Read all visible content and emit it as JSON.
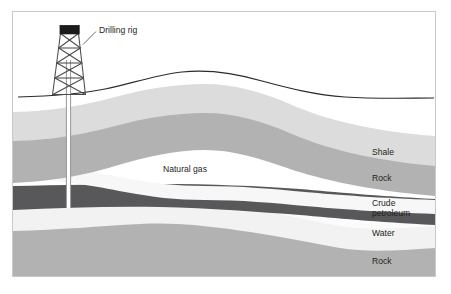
{
  "figure": {
    "title": "",
    "type": "geological-cross-section",
    "background_color": "#ffffff",
    "frame_border_color": "#c9c9c9"
  },
  "annotations": {
    "drilling_rig_label": "Drilling rig",
    "natural_gas_label": "Natural gas"
  },
  "side_labels": [
    {
      "text": "Shale",
      "color": "#dcdcdc"
    },
    {
      "text": "Rock",
      "color": "#b2b2b2"
    },
    {
      "text": "Crude",
      "color": "#58585a"
    },
    {
      "text": "petroleum",
      "color": "#58585a"
    },
    {
      "text": "Water",
      "color": "#f2f2f2"
    },
    {
      "text": "Rock",
      "color": "#b2b2b2"
    }
  ],
  "layers": [
    {
      "name": "sky-air",
      "label": "",
      "color": "#ffffff"
    },
    {
      "name": "shale",
      "label": "Shale",
      "color": "#dcdcdc"
    },
    {
      "name": "rock-upper",
      "label": "Rock",
      "color": "#b2b2b2"
    },
    {
      "name": "natural-gas",
      "label": "Natural gas",
      "color": "#f7f7f7"
    },
    {
      "name": "crude-petroleum",
      "label": "Crude petroleum",
      "color": "#58585a"
    },
    {
      "name": "water",
      "label": "Water",
      "color": "#f2f2f2"
    },
    {
      "name": "rock-lower",
      "label": "Rock",
      "color": "#b2b2b2"
    },
    {
      "name": "basement",
      "label": "",
      "color": "#fbfbfb"
    }
  ],
  "rig": {
    "cap_color": "#1b1b1b",
    "structure_color": "#4a4a4a",
    "pipe_color": "#ffffff",
    "pipe_edge_color": "#8a8a8a"
  },
  "ground": {
    "line_color": "#2b2b2b"
  },
  "leader": {
    "line_color": "#58585a"
  }
}
